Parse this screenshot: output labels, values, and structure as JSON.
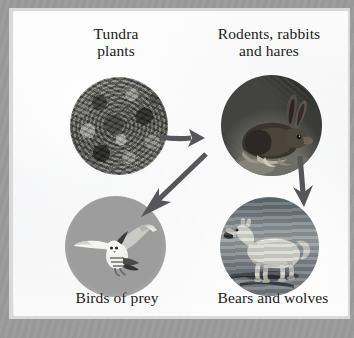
{
  "diagram": {
    "nodes": [
      {
        "id": "tundra-plants",
        "label": "Tundra\nplants",
        "trophic_level": "producers",
        "image": "photo of low mossy tundra vegetation",
        "shape": "circle"
      },
      {
        "id": "rodents-rabbits-hares",
        "label": "Rodents, rabbits\nand hares",
        "trophic_level": "primary consumers",
        "image": "photo of an arctic hare sitting on tundra ground",
        "shape": "circle"
      },
      {
        "id": "birds-of-prey",
        "label": "Birds of prey",
        "trophic_level": "secondary consumers",
        "image": "photo of a snowy owl in flight",
        "shape": "circle"
      },
      {
        "id": "bears-and-wolves",
        "label": "Bears and wolves",
        "trophic_level": "secondary consumers",
        "image": "photo of an arctic wolf walking on ice",
        "shape": "circle"
      }
    ],
    "arrows": [
      {
        "id": "plants-to-hares",
        "from": "tundra-plants",
        "to": "rodents-rabbits-hares",
        "direction": "right"
      },
      {
        "id": "hares-to-birds",
        "from": "rodents-rabbits-hares",
        "to": "birds-of-prey",
        "direction": "down-left"
      },
      {
        "id": "hares-to-bears",
        "from": "rodents-rabbits-hares",
        "to": "bears-and-wolves",
        "direction": "down"
      }
    ]
  },
  "colors": {
    "frame_outer": "#9b9b9b",
    "frame_inner": "#d9d9d9",
    "canvas": "#f4f4f4",
    "text": "#1a1a1a",
    "arrow": "#56565a",
    "owl_disc": "#9d9d9d",
    "wolf_ice": "#8c9295"
  }
}
